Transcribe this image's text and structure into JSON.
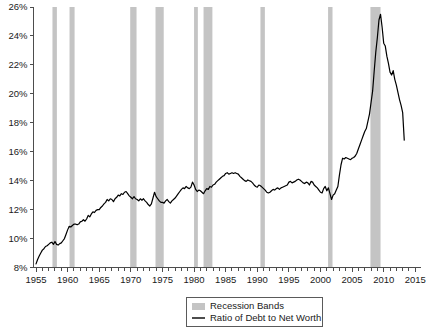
{
  "chart_data": {
    "type": "line",
    "title": "",
    "xlabel": "",
    "ylabel": "",
    "xlim": [
      1954.6,
      2015.9
    ],
    "ylim": [
      8,
      26
    ],
    "grid": false,
    "legend_position": "bottom-center",
    "y_tick_labels": [
      "8%",
      "10%",
      "12%",
      "14%",
      "16%",
      "18%",
      "20%",
      "22%",
      "24%",
      "26%"
    ],
    "y_tick_values": [
      8,
      10,
      12,
      14,
      16,
      18,
      20,
      22,
      24,
      26
    ],
    "x_tick_labels": [
      "1955",
      "1960",
      "1965",
      "1970",
      "1975",
      "1980",
      "1985",
      "1990",
      "1995",
      "2000",
      "2005",
      "2010",
      "2015"
    ],
    "x_tick_values": [
      1955,
      1960,
      1965,
      1970,
      1975,
      1980,
      1985,
      1990,
      1995,
      2000,
      2005,
      2010,
      2015
    ],
    "x_minor_step": 1,
    "series": [
      {
        "name": "Ratio of Debt to Net Worth",
        "color": "#000000",
        "x": [
          1955.0,
          1955.25,
          1955.5,
          1955.75,
          1956.0,
          1956.25,
          1956.5,
          1956.75,
          1957.0,
          1957.25,
          1957.5,
          1957.75,
          1958.0,
          1958.25,
          1958.5,
          1958.75,
          1959.0,
          1959.25,
          1959.5,
          1959.75,
          1960.0,
          1960.25,
          1960.5,
          1960.75,
          1961.0,
          1961.25,
          1961.5,
          1961.75,
          1962.0,
          1962.25,
          1962.5,
          1962.75,
          1963.0,
          1963.25,
          1963.5,
          1963.75,
          1964.0,
          1964.25,
          1964.5,
          1964.75,
          1965.0,
          1965.25,
          1965.5,
          1965.75,
          1966.0,
          1966.25,
          1966.5,
          1966.75,
          1967.0,
          1967.25,
          1967.5,
          1967.75,
          1968.0,
          1968.25,
          1968.5,
          1968.75,
          1969.0,
          1969.25,
          1969.5,
          1969.75,
          1970.0,
          1970.25,
          1970.5,
          1970.75,
          1971.0,
          1971.25,
          1971.5,
          1971.75,
          1972.0,
          1972.25,
          1972.5,
          1972.75,
          1973.0,
          1973.25,
          1973.5,
          1973.75,
          1974.0,
          1974.25,
          1974.5,
          1974.75,
          1975.0,
          1975.25,
          1975.5,
          1975.75,
          1976.0,
          1976.25,
          1976.5,
          1976.75,
          1977.0,
          1977.25,
          1977.5,
          1977.75,
          1978.0,
          1978.25,
          1978.5,
          1978.75,
          1979.0,
          1979.25,
          1979.5,
          1979.75,
          1980.0,
          1980.25,
          1980.5,
          1980.75,
          1981.0,
          1981.25,
          1981.5,
          1981.75,
          1982.0,
          1982.25,
          1982.5,
          1982.75,
          1983.0,
          1983.25,
          1983.5,
          1983.75,
          1984.0,
          1984.25,
          1984.5,
          1984.75,
          1985.0,
          1985.25,
          1985.5,
          1985.75,
          1986.0,
          1986.25,
          1986.5,
          1986.75,
          1987.0,
          1987.25,
          1987.5,
          1987.75,
          1988.0,
          1988.25,
          1988.5,
          1988.75,
          1989.0,
          1989.25,
          1989.5,
          1989.75,
          1990.0,
          1990.25,
          1990.5,
          1990.75,
          1991.0,
          1991.25,
          1991.5,
          1991.75,
          1992.0,
          1992.25,
          1992.5,
          1992.75,
          1993.0,
          1993.25,
          1993.5,
          1993.75,
          1994.0,
          1994.25,
          1994.5,
          1994.75,
          1995.0,
          1995.25,
          1995.5,
          1995.75,
          1996.0,
          1996.25,
          1996.5,
          1996.75,
          1997.0,
          1997.25,
          1997.5,
          1997.75,
          1998.0,
          1998.25,
          1998.5,
          1998.75,
          1999.0,
          1999.25,
          1999.5,
          1999.75,
          2000.0,
          2000.25,
          2000.5,
          2000.75,
          2001.0,
          2001.25,
          2001.5,
          2001.75,
          2002.0,
          2002.25,
          2002.5,
          2002.75,
          2003.0,
          2003.25,
          2003.5,
          2003.75,
          2004.0,
          2004.25,
          2004.5,
          2004.75,
          2005.0,
          2005.25,
          2005.5,
          2005.75,
          2006.0,
          2006.25,
          2006.5,
          2006.75,
          2007.0,
          2007.25,
          2007.5,
          2007.75,
          2008.0,
          2008.25,
          2008.5,
          2008.75,
          2009.0,
          2009.25,
          2009.5,
          2009.75,
          2010.0,
          2010.25,
          2010.5,
          2010.75,
          2011.0,
          2011.25,
          2011.5,
          2011.75,
          2012.0,
          2012.25,
          2012.5,
          2012.75,
          2013.0,
          2013.25
        ],
        "y": [
          8.25,
          8.55,
          8.8,
          9.0,
          9.2,
          9.3,
          9.45,
          9.5,
          9.6,
          9.7,
          9.75,
          9.6,
          9.8,
          9.6,
          9.55,
          9.65,
          9.7,
          9.85,
          10.0,
          10.3,
          10.6,
          10.85,
          10.8,
          10.9,
          11.0,
          11.0,
          10.95,
          11.0,
          11.15,
          11.2,
          11.3,
          11.2,
          11.35,
          11.6,
          11.5,
          11.7,
          11.85,
          11.8,
          11.95,
          12.0,
          12.0,
          12.15,
          12.25,
          12.4,
          12.5,
          12.7,
          12.6,
          12.75,
          12.7,
          12.55,
          12.75,
          12.85,
          13.0,
          12.95,
          13.1,
          13.05,
          13.2,
          13.25,
          13.1,
          12.95,
          12.85,
          12.75,
          12.9,
          12.75,
          12.7,
          12.6,
          12.75,
          12.65,
          12.75,
          12.6,
          12.5,
          12.35,
          12.25,
          12.4,
          12.8,
          13.2,
          12.9,
          12.75,
          12.6,
          12.5,
          12.5,
          12.45,
          12.6,
          12.7,
          12.55,
          12.45,
          12.6,
          12.7,
          12.8,
          12.95,
          13.1,
          13.25,
          13.4,
          13.5,
          13.45,
          13.6,
          13.5,
          13.45,
          13.55,
          13.9,
          13.7,
          13.4,
          13.25,
          13.35,
          13.3,
          13.2,
          13.1,
          13.3,
          13.45,
          13.4,
          13.6,
          13.55,
          13.7,
          13.75,
          13.9,
          14.0,
          14.1,
          14.2,
          14.3,
          14.35,
          14.5,
          14.55,
          14.45,
          14.5,
          14.55,
          14.5,
          14.55,
          14.5,
          14.45,
          14.3,
          14.2,
          14.1,
          14.0,
          13.95,
          14.05,
          14.0,
          13.95,
          13.85,
          13.7,
          13.6,
          13.55,
          13.7,
          13.65,
          13.55,
          13.45,
          13.35,
          13.2,
          13.15,
          13.2,
          13.3,
          13.4,
          13.35,
          13.45,
          13.5,
          13.4,
          13.5,
          13.55,
          13.6,
          13.65,
          13.7,
          13.9,
          13.95,
          13.85,
          13.9,
          13.95,
          14.05,
          14.1,
          14.05,
          13.95,
          13.85,
          13.8,
          13.9,
          13.85,
          13.7,
          13.95,
          13.9,
          13.7,
          13.6,
          13.5,
          13.35,
          13.2,
          13.15,
          13.45,
          13.6,
          13.3,
          13.5,
          13.1,
          12.7,
          13.0,
          13.1,
          13.35,
          13.6,
          14.4,
          15.1,
          15.55,
          15.5,
          15.6,
          15.55,
          15.5,
          15.45,
          15.55,
          15.6,
          15.7,
          15.9,
          16.2,
          16.5,
          16.8,
          17.1,
          17.4,
          17.6,
          18.1,
          18.6,
          19.4,
          20.2,
          21.6,
          22.9,
          23.9,
          25.1,
          25.5,
          24.6,
          23.5,
          23.3,
          22.6,
          22.1,
          21.5,
          21.3,
          21.6,
          21.0,
          20.6,
          20.1,
          19.6,
          19.2,
          18.7,
          16.8
        ]
      }
    ],
    "recession_bands": [
      {
        "start": 1957.6,
        "end": 1958.3
      },
      {
        "start": 1960.3,
        "end": 1961.1
      },
      {
        "start": 1969.9,
        "end": 1970.9
      },
      {
        "start": 1973.9,
        "end": 1975.2
      },
      {
        "start": 1980.0,
        "end": 1980.6
      },
      {
        "start": 1981.5,
        "end": 1982.9
      },
      {
        "start": 1990.5,
        "end": 1991.2
      },
      {
        "start": 2001.2,
        "end": 2001.9
      },
      {
        "start": 2007.9,
        "end": 2009.5
      }
    ]
  },
  "legend": {
    "items": [
      {
        "label": "Recession Bands",
        "marker": "swatch",
        "color": "#c4c4c4"
      },
      {
        "label": "Ratio of Debt to Net Worth",
        "marker": "line",
        "color": "#000000"
      }
    ]
  },
  "colors": {
    "recession_band": "#c4c4c4",
    "line": "#000000",
    "axis": "#4d4d4d",
    "text": "#1a1a1a",
    "background": "#ffffff"
  }
}
